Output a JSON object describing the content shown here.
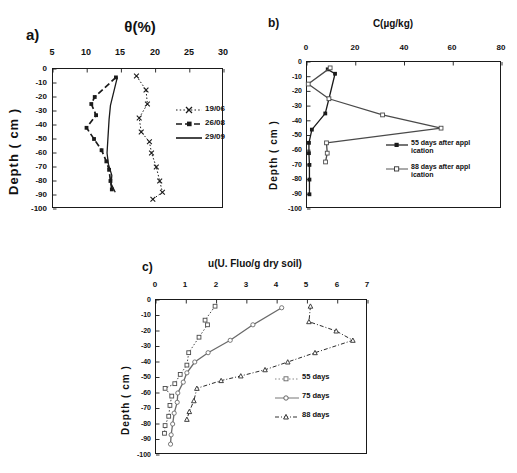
{
  "figure": {
    "background": "#ffffff",
    "ink": "#1a1a1a"
  },
  "panels": {
    "a": {
      "letter": "a)",
      "title": "θ(%)",
      "xlabel": "",
      "ylabel": "Depth ( cm )",
      "xticks": [
        "5",
        "10",
        "15",
        "20",
        "25",
        "30"
      ],
      "yticks": [
        "0",
        "-10",
        "-20",
        "-30",
        "-40",
        "-50",
        "-60",
        "-70",
        "-80",
        "-90",
        "-100"
      ],
      "legend": [
        {
          "label": "19/06",
          "style": "dotted-cross"
        },
        {
          "label": "26/08",
          "style": "dashed-square"
        },
        {
          "label": "29/09",
          "style": "solid-plain"
        }
      ]
    },
    "b": {
      "letter": "b)",
      "title": "C(µg/kg)",
      "ylabel": "Depth ( cm )",
      "xticks": [
        "0",
        "20",
        "40",
        "60",
        "80"
      ],
      "yticks": [
        "0",
        "-10",
        "-20",
        "-30",
        "-40",
        "-50",
        "-60",
        "-70",
        "-80",
        "-90",
        "-100"
      ],
      "legend": [
        {
          "label": "55 days after appl ication",
          "style": "solid-filled-square"
        },
        {
          "label": "88 days after appl ication",
          "style": "solid-open-square"
        }
      ]
    },
    "c": {
      "letter": "c)",
      "title": "u(U. Fluo/g dry soil)",
      "ylabel": "Depth ( cm )",
      "xticks": [
        "0",
        "1",
        "2",
        "3",
        "4",
        "5",
        "6",
        "7"
      ],
      "yticks": [
        "0",
        "-10",
        "-20",
        "-30",
        "-40",
        "-50",
        "-60",
        "-70",
        "-80",
        "-90",
        "-100"
      ],
      "legend": [
        {
          "label": "55 days",
          "style": "dotted-open-square"
        },
        {
          "label": "75 days",
          "style": "solid-open-circle"
        },
        {
          "label": "88 days",
          "style": "dashdot-open-triangle"
        }
      ]
    }
  },
  "chart_data": [
    {
      "type": "line",
      "panel": "a",
      "title": "θ(%)",
      "xlabel": "θ(%)",
      "ylabel": "Depth ( cm )",
      "xlim": [
        5,
        30
      ],
      "ylim": [
        -100,
        0
      ],
      "grid": false,
      "orientation": "depth-profile",
      "legend_position": "right-inside",
      "series": [
        {
          "name": "19/06",
          "marker": "cross",
          "linestyle": "dotted",
          "points": [
            {
              "x": 17.2,
              "y": -5
            },
            {
              "x": 18.6,
              "y": -15
            },
            {
              "x": 18.8,
              "y": -25
            },
            {
              "x": 17.6,
              "y": -35
            },
            {
              "x": 17.9,
              "y": -45
            },
            {
              "x": 19.1,
              "y": -52
            },
            {
              "x": 19.4,
              "y": -60
            },
            {
              "x": 20.1,
              "y": -70
            },
            {
              "x": 20.6,
              "y": -80
            },
            {
              "x": 21.0,
              "y": -88
            },
            {
              "x": 19.6,
              "y": -93
            }
          ]
        },
        {
          "name": "26/08",
          "marker": "square",
          "linestyle": "dashed",
          "points": [
            {
              "x": 14.2,
              "y": -6
            },
            {
              "x": 11.1,
              "y": -20
            },
            {
              "x": 10.6,
              "y": -25
            },
            {
              "x": 11.3,
              "y": -33
            },
            {
              "x": 9.9,
              "y": -42
            },
            {
              "x": 11.0,
              "y": -50
            },
            {
              "x": 12.1,
              "y": -58
            },
            {
              "x": 12.8,
              "y": -66
            },
            {
              "x": 13.2,
              "y": -72
            },
            {
              "x": 13.4,
              "y": -80
            },
            {
              "x": 13.6,
              "y": -86
            }
          ]
        },
        {
          "name": "29/09",
          "marker": "none",
          "linestyle": "solid",
          "points": [
            {
              "x": 14.4,
              "y": -6
            },
            {
              "x": 13.9,
              "y": -16
            },
            {
              "x": 13.4,
              "y": -26
            },
            {
              "x": 13.2,
              "y": -36
            },
            {
              "x": 13.1,
              "y": -44
            },
            {
              "x": 13.0,
              "y": -52
            },
            {
              "x": 12.9,
              "y": -60
            },
            {
              "x": 13.1,
              "y": -68
            },
            {
              "x": 13.6,
              "y": -76
            },
            {
              "x": 13.5,
              "y": -82
            },
            {
              "x": 14.1,
              "y": -88
            }
          ]
        }
      ]
    },
    {
      "type": "line",
      "panel": "b",
      "title": "C(µg/kg)",
      "xlabel": "C(µg/kg)",
      "ylabel": "Depth ( cm )",
      "xlim": [
        0,
        80
      ],
      "ylim": [
        -100,
        0
      ],
      "grid": false,
      "orientation": "depth-profile",
      "legend_position": "right-inside",
      "series": [
        {
          "name": "55 days after application",
          "marker": "filled-square",
          "linestyle": "solid",
          "points": [
            {
              "x": 8.5,
              "y": -5
            },
            {
              "x": 11.5,
              "y": -8
            },
            {
              "x": 9.0,
              "y": -25
            },
            {
              "x": 7.5,
              "y": -35
            },
            {
              "x": 2.0,
              "y": -46
            },
            {
              "x": 0.8,
              "y": -55
            },
            {
              "x": 0.8,
              "y": -62
            },
            {
              "x": 1.0,
              "y": -70
            },
            {
              "x": 1.0,
              "y": -80
            },
            {
              "x": 1.0,
              "y": -90
            }
          ]
        },
        {
          "name": "88 days after application",
          "marker": "open-square",
          "linestyle": "solid",
          "points": [
            {
              "x": 9.5,
              "y": -4
            },
            {
              "x": 0.5,
              "y": -15
            },
            {
              "x": 9.0,
              "y": -25
            },
            {
              "x": 31.0,
              "y": -36
            },
            {
              "x": 55.0,
              "y": -45
            },
            {
              "x": 8.0,
              "y": -55
            },
            {
              "x": 8.3,
              "y": -62
            },
            {
              "x": 7.6,
              "y": -68
            }
          ]
        }
      ]
    },
    {
      "type": "line",
      "panel": "c",
      "title": "u(U. Fluo/g dry soil)",
      "xlabel": "u(U. Fluo/g dry soil)",
      "ylabel": "Depth ( cm )",
      "xlim": [
        0,
        7
      ],
      "ylim": [
        -100,
        0
      ],
      "grid": false,
      "orientation": "depth-profile",
      "legend_position": "right-inside",
      "series": [
        {
          "name": "55 days",
          "marker": "open-square",
          "linestyle": "dotted",
          "points": [
            {
              "x": 1.95,
              "y": -4
            },
            {
              "x": 1.62,
              "y": -13
            },
            {
              "x": 1.7,
              "y": -16
            },
            {
              "x": 1.42,
              "y": -24
            },
            {
              "x": 1.08,
              "y": -34
            },
            {
              "x": 1.02,
              "y": -42
            },
            {
              "x": 0.8,
              "y": -48
            },
            {
              "x": 0.62,
              "y": -54
            },
            {
              "x": 0.3,
              "y": -57
            },
            {
              "x": 0.52,
              "y": -62
            },
            {
              "x": 0.46,
              "y": -68
            },
            {
              "x": 0.42,
              "y": -75
            },
            {
              "x": 0.3,
              "y": -81
            },
            {
              "x": 0.28,
              "y": -86
            }
          ]
        },
        {
          "name": "75 days",
          "marker": "open-circle",
          "linestyle": "solid",
          "points": [
            {
              "x": 4.15,
              "y": -5
            },
            {
              "x": 3.2,
              "y": -16
            },
            {
              "x": 2.45,
              "y": -26
            },
            {
              "x": 1.72,
              "y": -34
            },
            {
              "x": 1.28,
              "y": -40
            },
            {
              "x": 1.02,
              "y": -47
            },
            {
              "x": 0.9,
              "y": -53
            },
            {
              "x": 0.72,
              "y": -60
            },
            {
              "x": 0.7,
              "y": -66
            },
            {
              "x": 0.6,
              "y": -73
            },
            {
              "x": 0.55,
              "y": -80
            },
            {
              "x": 0.5,
              "y": -87
            },
            {
              "x": 0.48,
              "y": -93
            }
          ]
        },
        {
          "name": "88 days",
          "marker": "open-triangle",
          "linestyle": "dash-dot",
          "points": [
            {
              "x": 5.1,
              "y": -4
            },
            {
              "x": 5.05,
              "y": -14
            },
            {
              "x": 5.95,
              "y": -20
            },
            {
              "x": 6.5,
              "y": -26
            },
            {
              "x": 5.25,
              "y": -34
            },
            {
              "x": 4.35,
              "y": -40
            },
            {
              "x": 3.6,
              "y": -45
            },
            {
              "x": 2.8,
              "y": -49
            },
            {
              "x": 2.15,
              "y": -52
            },
            {
              "x": 1.35,
              "y": -57
            },
            {
              "x": 1.25,
              "y": -65
            },
            {
              "x": 1.1,
              "y": -72
            },
            {
              "x": 1.02,
              "y": -77
            }
          ]
        }
      ]
    }
  ]
}
